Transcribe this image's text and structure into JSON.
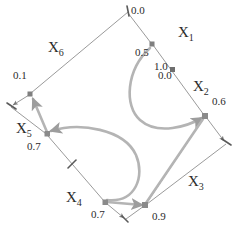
{
  "figure": {
    "type": "graph-diagram",
    "background": "#ffffff",
    "line_color": "#8f8f8f",
    "curve_color": "#b4b4b4",
    "node_color": "#7f7f7f",
    "text_color": "#2b2b2b"
  },
  "nodes": [
    {
      "id": "x1",
      "name": "X",
      "sub": "1",
      "value": "0.5",
      "x": 152,
      "y": 44,
      "label_x": 178,
      "label_y": 33,
      "value_x": 136,
      "value_y": 52
    },
    {
      "id": "x2",
      "name": "X",
      "sub": "2",
      "value": "0.6",
      "x": 205,
      "y": 116,
      "label_x": 195,
      "label_y": 87,
      "value_x": 212,
      "value_y": 101
    },
    {
      "id": "x3",
      "name": "X",
      "sub": "3",
      "value": "0.9",
      "x": 145,
      "y": 205,
      "label_x": 189,
      "label_y": 181,
      "value_x": 152,
      "value_y": 214
    },
    {
      "id": "x4",
      "name": "X",
      "sub": "4",
      "value": "0.7",
      "x": 105,
      "y": 202,
      "label_x": 67,
      "label_y": 196,
      "value_x": 92,
      "value_y": 212
    },
    {
      "id": "x5",
      "name": "X",
      "sub": "5",
      "value": "0.7",
      "x": 47,
      "y": 134,
      "label_x": 18,
      "label_y": 126,
      "value_x": 28,
      "value_y": 145
    },
    {
      "id": "x6",
      "name": "X",
      "sub": "6",
      "value": "0.1",
      "x": 30,
      "y": 94,
      "label_x": 49,
      "label_y": 44,
      "value_x": 14,
      "value_y": 74
    }
  ],
  "edge_values": [
    {
      "id": "top-tick",
      "value": "0.0",
      "x": 131,
      "y": 10
    },
    {
      "id": "x1-x2-upper",
      "value": "1.0",
      "x": 155,
      "y": 66
    },
    {
      "id": "x1-x2-lower",
      "value": "0.0",
      "x": 159,
      "y": 75
    }
  ],
  "graph": {
    "straight_edges": [
      {
        "from": "top-vertex",
        "to": "x6-node",
        "x1": 128,
        "y1": 12,
        "x2": 30,
        "y2": 94
      },
      {
        "from": "top-vertex",
        "to": "x1",
        "x1": 128,
        "y1": 12,
        "x2": 152,
        "y2": 44
      },
      {
        "from": "x1",
        "to": "x2",
        "x1": 152,
        "y1": 44,
        "x2": 205,
        "y2": 116
      },
      {
        "from": "x2",
        "to": "right-vertex",
        "x1": 205,
        "y1": 116,
        "x2": 226,
        "y2": 143
      },
      {
        "from": "right-vertex",
        "to": "x3",
        "x1": 226,
        "y1": 143,
        "x2": 145,
        "y2": 205
      },
      {
        "from": "x6-node",
        "to": "left-vertex",
        "x1": 30,
        "y1": 94,
        "x2": 11,
        "y2": 106
      },
      {
        "from": "left-vertex",
        "to": "x5",
        "x1": 11,
        "y1": 106,
        "x2": 47,
        "y2": 134
      },
      {
        "from": "x6-node",
        "to": "x5",
        "x1": 30,
        "y1": 94,
        "x2": 47,
        "y2": 134
      },
      {
        "from": "x5",
        "to": "x4",
        "x1": 47,
        "y1": 134,
        "x2": 105,
        "y2": 202
      },
      {
        "from": "x4",
        "to": "bottom-vertex",
        "x1": 105,
        "y1": 202,
        "x2": 125,
        "y2": 220
      },
      {
        "from": "bottom-vertex",
        "to": "x3",
        "x1": 125,
        "y1": 220,
        "x2": 145,
        "y2": 205
      },
      {
        "from": "x3",
        "to": "x2",
        "x1": 145,
        "y1": 205,
        "x2": 205,
        "y2": 116
      }
    ],
    "curved_edges": [
      {
        "from": "x1",
        "to": "x2",
        "bulge": "left"
      },
      {
        "from": "x4",
        "to": "x5",
        "bulge": "right"
      }
    ],
    "thick_edges": [
      {
        "from": "x3",
        "to": "x2"
      },
      {
        "from": "x4",
        "to": "x3"
      }
    ],
    "tick_marks": [
      {
        "id": "tick-top",
        "x": 128,
        "y": 12
      },
      {
        "id": "tick-x5-x4",
        "x": 72,
        "y": 165
      }
    ],
    "arrowheads": [
      {
        "id": "arrow-to-x2",
        "at": "x2"
      },
      {
        "id": "arrow-to-x5",
        "at": "x5"
      },
      {
        "id": "arrow-to-left-vertex",
        "at": "left-vertex"
      },
      {
        "id": "arrow-to-x5-from-x6",
        "at": "x5"
      },
      {
        "id": "arrow-to-bottom-vertex",
        "at": "bottom-vertex"
      },
      {
        "id": "arrow-to-x3",
        "at": "x3"
      },
      {
        "id": "arrow-to-right-vertex",
        "at": "right-vertex"
      },
      {
        "id": "arrow-up-to-x6",
        "at": "x6-node"
      }
    ]
  }
}
